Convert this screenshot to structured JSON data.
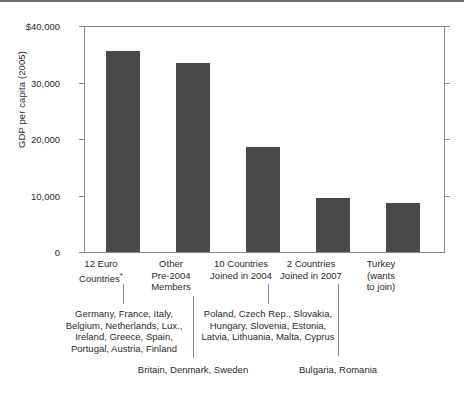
{
  "chart_data": {
    "type": "bar",
    "title": "",
    "xlabel": "",
    "ylabel": "GDP per capita (2005)",
    "ylim": [
      0,
      40000
    ],
    "grid": false,
    "legend": null,
    "ytick_labels": [
      "$40,000",
      "30,000",
      "20,000",
      "10,000",
      "0"
    ],
    "ytick_values": [
      40000,
      30000,
      20000,
      10000,
      0
    ],
    "categories": [
      "12 Euro Countries*",
      "Other Pre-2004 Members",
      "10 Countries Joined in 2004",
      "2 Countries Joined in 2007",
      "Turkey (wants to join)"
    ],
    "values": [
      35500,
      33500,
      18500,
      9600,
      8600
    ],
    "bar_color": "#4a4a4a",
    "annotations": [
      "Germany, France, Italy, Belgium, Netherlands, Lux., Ireland, Greece, Spain, Portugal, Austria, Finland",
      "Britain, Denmark, Sweden",
      "Poland, Czech Rep., Slovakia, Hungary, Slovenia, Estonia, Latvia, Lithuania, Malta, Cyprus",
      "Bulgaria, Romania"
    ]
  },
  "axis": {
    "y_title": "GDP per capita (2005)",
    "ticks": [
      {
        "label": "$40,000",
        "value": 40000
      },
      {
        "label": "30,000",
        "value": 30000
      },
      {
        "label": "20,000",
        "value": 20000
      },
      {
        "label": "10,000",
        "value": 10000
      },
      {
        "label": "0",
        "value": 0
      }
    ]
  },
  "categories": [
    {
      "line1": "12 Euro",
      "line2": "Countries",
      "asterisk": "*",
      "line3": ""
    },
    {
      "line1": "Other",
      "line2": "Pre-2004",
      "asterisk": "",
      "line3": "Members"
    },
    {
      "line1": "10 Countries",
      "line2": "Joined in 2004",
      "asterisk": "",
      "line3": ""
    },
    {
      "line1": "2 Countries",
      "line2": "Joined in 2007",
      "asterisk": "",
      "line3": ""
    },
    {
      "line1": "Turkey",
      "line2": "(wants",
      "asterisk": "",
      "line3": "to join)"
    }
  ],
  "notes": {
    "euro12": {
      "line1": "Germany, France, Italy,",
      "line2": "Belgium, Netherlands, Lux.,",
      "line3": "Ireland, Greece, Spain,",
      "line4": "Portugal, Austria, Finland"
    },
    "pre2004": {
      "line1": "Britain, Denmark, Sweden"
    },
    "joined2004": {
      "line1": "Poland, Czech Rep., Slovakia,",
      "line2": "Hungary, Slovenia, Estonia,",
      "line3": "Latvia, Lithuania, Malta, Cyprus"
    },
    "joined2007": {
      "line1": "Bulgaria, Romania"
    }
  }
}
